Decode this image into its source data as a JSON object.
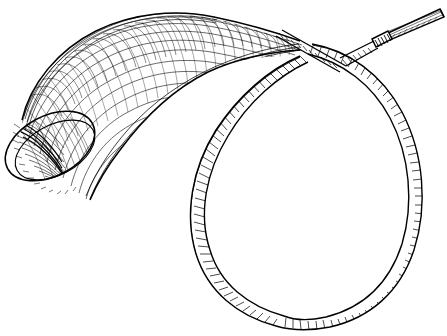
{
  "artwork": {
    "title": "Powder Horn",
    "subject": "powder-horn-with-carrying-strap",
    "medium": "line engraving / pen-and-ink hatching",
    "style": "cross-hatched antique engraving",
    "alt_text": "Black and white engraving of a curved powder horn with an open flared mouth at left, tapering to a narrow spout at upper right, and a long cord strap looped into a large oval that crosses itself near the spout.",
    "background_color": "#ffffff",
    "ink_color": "#000000",
    "canvas": {
      "width": 447,
      "height": 336
    }
  },
  "parts": [
    {
      "id": "horn-body",
      "label": "Horn body",
      "description": "Curved conical horn tapering from the wide open mouth at lower left up and to the right",
      "bounds": {
        "x": 8,
        "y": 12,
        "width": 290,
        "height": 190
      }
    },
    {
      "id": "horn-mouth",
      "label": "Horn mouth opening",
      "description": "Elliptical open end of the horn, tilted about sixty degrees, deeply cross-hatched inside",
      "center": {
        "x": 50,
        "y": 146
      },
      "radius_x": 30,
      "radius_y": 48,
      "rotation_deg": 62
    },
    {
      "id": "horn-spout",
      "label": "Spout nozzle",
      "description": "Narrow straight cylindrical nozzle with a ribbed collar at the upper right tip",
      "bounds": {
        "x": 375,
        "y": 8,
        "width": 68,
        "height": 26
      }
    },
    {
      "id": "spout-collar",
      "label": "Spout collar",
      "description": "Short banded ferrule where the nozzle meets the cord",
      "bounds": {
        "x": 372,
        "y": 16,
        "width": 16,
        "height": 16
      }
    },
    {
      "id": "strap-loop",
      "label": "Carrying strap loop",
      "description": "Long cord forming a large oval loop occupying the right and lower portion of the image",
      "bounds": {
        "x": 186,
        "y": 36,
        "width": 240,
        "height": 292
      }
    },
    {
      "id": "strap-crossing",
      "label": "Strap crossing point",
      "description": "X shaped overlap where the two ends of the cord cross just left of the spout",
      "center": {
        "x": 305,
        "y": 48
      }
    }
  ],
  "texture": {
    "hatch_label": "cross-hatching",
    "hatch_lines_horn": 150,
    "hatch_lines_strap": 330,
    "stroke_width_fine": 0.6,
    "stroke_width_outline": 1.6
  }
}
